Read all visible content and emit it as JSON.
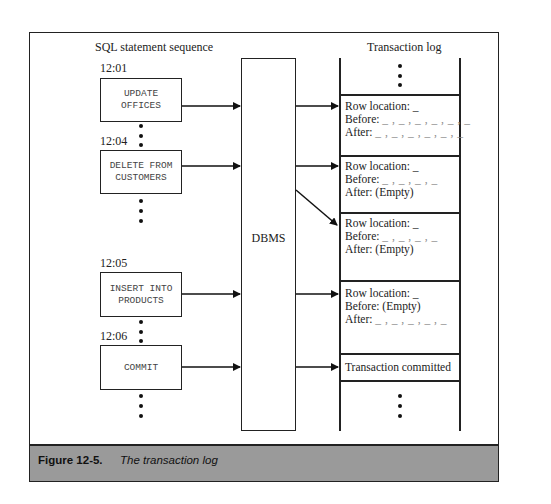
{
  "figure": {
    "label": "Figure 12-5.",
    "title": "The transaction log"
  },
  "diagram": {
    "left_heading": "SQL statement sequence",
    "right_heading": "Transaction log",
    "dbms_label": "DBMS",
    "statements": [
      {
        "time": "12:01",
        "text": "UPDATE\nOFFICES"
      },
      {
        "time": "12:04",
        "text": "DELETE FROM\nCUSTOMERS"
      },
      {
        "time": "12:05",
        "text": "INSERT INTO\nPRODUCTS"
      },
      {
        "time": "12:06",
        "text": "COMMIT"
      }
    ],
    "log_entries": [
      {
        "row_location": "Row location: _",
        "before": "Before: ",
        "before_val": "_ , _ , _ , _ , _ , _",
        "after": "After: ",
        "after_val": "_ , _ , _ , _ , _ , _"
      },
      {
        "row_location": "Row location: _",
        "before": "Before: ",
        "before_val": "_ , _ , _ , _",
        "after": "After: (Empty)",
        "after_val": ""
      },
      {
        "row_location": "Row location: _",
        "before": "Before: ",
        "before_val": "_ , _ , _ , _",
        "after": "After: (Empty)",
        "after_val": ""
      },
      {
        "row_location": "Row location: _",
        "before": "Before: (Empty)",
        "before_val": "",
        "after": "After: ",
        "after_val": "_ , _ , _ , _ , _"
      },
      {
        "committed": "Transaction committed"
      }
    ]
  }
}
